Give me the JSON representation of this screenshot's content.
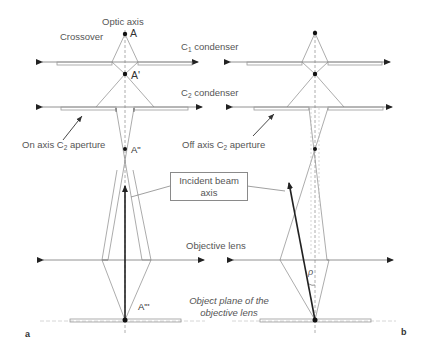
{
  "labels": {
    "optic_axis": "Optic axis",
    "crossover": "Crossover",
    "c1_condenser_prefix": "C",
    "c1_condenser_sub": "1",
    "c1_condenser_suffix": " condenser",
    "c2_condenser_prefix": "C",
    "c2_condenser_sub": "2",
    "c2_condenser_suffix": " condenser",
    "on_axis_prefix": "On axis C",
    "on_axis_sub": "2",
    "on_axis_suffix": " aperture",
    "off_axis_prefix": "Off axis C",
    "off_axis_sub": "2",
    "off_axis_suffix": " aperture",
    "incident_beam_line1": "Incident beam",
    "incident_beam_line2": "axis",
    "objective_lens": "Objective lens",
    "object_plane_line1": "Object plane of the",
    "object_plane_line2": "objective lens",
    "rho": "ρ"
  },
  "points": {
    "A": "A",
    "A_prime": "A'",
    "A_double_prime": "A\"",
    "A_triple_prime": "A\"'"
  },
  "panels": {
    "left": "a",
    "right": "b"
  },
  "colors": {
    "line": "#8a8a8a",
    "dark": "#222222",
    "text": "#555555"
  }
}
